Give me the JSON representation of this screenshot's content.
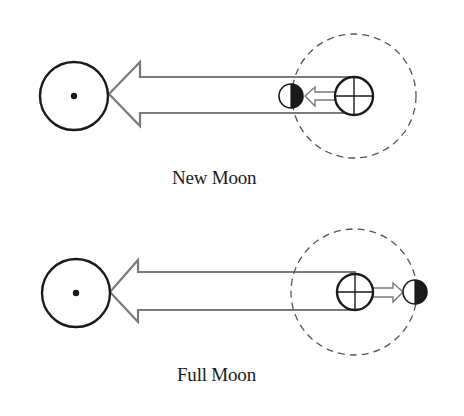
{
  "figure": {
    "panels": [
      {
        "id": "new-moon",
        "caption": "New Moon",
        "sun": {
          "cx": 74,
          "cy": 96,
          "r": 34
        },
        "sunlight_arrow": {
          "tip_x": 109,
          "head_x": 140,
          "tail_x": 354,
          "cy": 95,
          "shaft_half": 18,
          "head_half": 32
        },
        "orbit": {
          "cx": 354,
          "cy": 96,
          "r": 62
        },
        "earth": {
          "cx": 354,
          "cy": 96,
          "r": 19
        },
        "moon": {
          "cx": 291,
          "cy": 96,
          "r": 12,
          "dark_side": "right"
        },
        "pull_arrow": {
          "from_x": 335,
          "to_x": 305,
          "cy": 96,
          "direction": "left"
        }
      },
      {
        "id": "full-moon",
        "caption": "Full Moon",
        "sun": {
          "cx": 76,
          "cy": 293,
          "r": 34
        },
        "sunlight_arrow": {
          "tip_x": 110,
          "head_x": 138,
          "tail_x": 355,
          "cy": 291,
          "shaft_half": 19,
          "head_half": 31
        },
        "orbit": {
          "cx": 354,
          "cy": 292,
          "r": 63
        },
        "earth": {
          "cx": 355,
          "cy": 292,
          "r": 18
        },
        "moon": {
          "cx": 415,
          "cy": 292,
          "r": 12,
          "dark_side": "right"
        },
        "pull_arrow": {
          "from_x": 373,
          "to_x": 403,
          "cy": 292,
          "direction": "right"
        }
      }
    ],
    "symbols": {
      "sun": "circle-with-center-dot",
      "earth": "circle-with-cross",
      "moon": "half-shaded-circle"
    },
    "colors": {
      "stroke": "#1a1a1a",
      "arrow_outline": "#7a7a7a",
      "orbit_dash": "#555555",
      "background": "#ffffff"
    }
  }
}
